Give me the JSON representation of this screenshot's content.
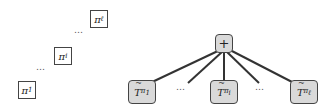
{
  "left_panel": {
    "nodes": [
      {
        "label": "π",
        "sub": "1"
      },
      {
        "label": "π",
        "sub": "i"
      },
      {
        "label": "π",
        "sub": "ℓ"
      }
    ],
    "ellipsis": "…"
  },
  "right_panel": {
    "root": {
      "label": "+"
    },
    "children": [
      {
        "label": "T",
        "sub": "π1",
        "sub_base": "π",
        "sub_index": "1"
      },
      {
        "label": "T",
        "sub": "πi",
        "sub_base": "π",
        "sub_index": "i"
      },
      {
        "label": "T",
        "sub": "πℓ",
        "sub_base": "π",
        "sub_index": "ℓ"
      }
    ],
    "ellipsis": "…"
  },
  "colors": {
    "node_fill": "#d9d9d9",
    "edge": "#333333",
    "border": "#444444"
  }
}
